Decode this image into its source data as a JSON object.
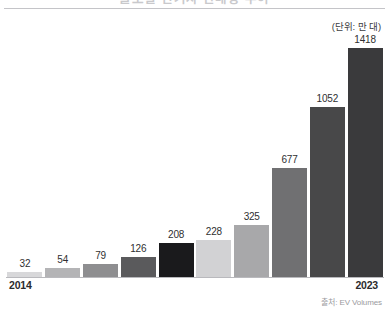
{
  "header": {
    "title": "글로벌 전기차 판매량 추이",
    "unit_note": "(단위: 만 대)"
  },
  "footer": {
    "source": "출처: EV Volumes"
  },
  "axis": {
    "first_year_label": "2014",
    "last_year_label": "2023"
  },
  "chart_data": {
    "type": "bar",
    "title": "글로벌 전기차 판매량 추이",
    "xlabel": "",
    "ylabel": "",
    "unit": "만 대",
    "source": "출처: EV Volumes",
    "grid": false,
    "legend": false,
    "ylim": [
      0,
      1418
    ],
    "categories": [
      "2014",
      "2015",
      "2016",
      "2017",
      "2018",
      "2019",
      "2020",
      "2021",
      "2022",
      "2023"
    ],
    "visible_tick_labels": [
      "2014",
      "2023"
    ],
    "values": [
      32,
      54,
      79,
      126,
      208,
      228,
      325,
      677,
      1052,
      1418
    ],
    "bar_colors": [
      "#d8d8da",
      "#b4b4b6",
      "#8e8e90",
      "#5a5a5c",
      "#1a1a1c",
      "#d2d2d4",
      "#a8a8aa",
      "#707072",
      "#484849",
      "#3a3a3c"
    ],
    "data_labels": [
      "32",
      "54",
      "79",
      "126",
      "208",
      "228",
      "325",
      "677",
      "1052",
      "1418"
    ]
  }
}
